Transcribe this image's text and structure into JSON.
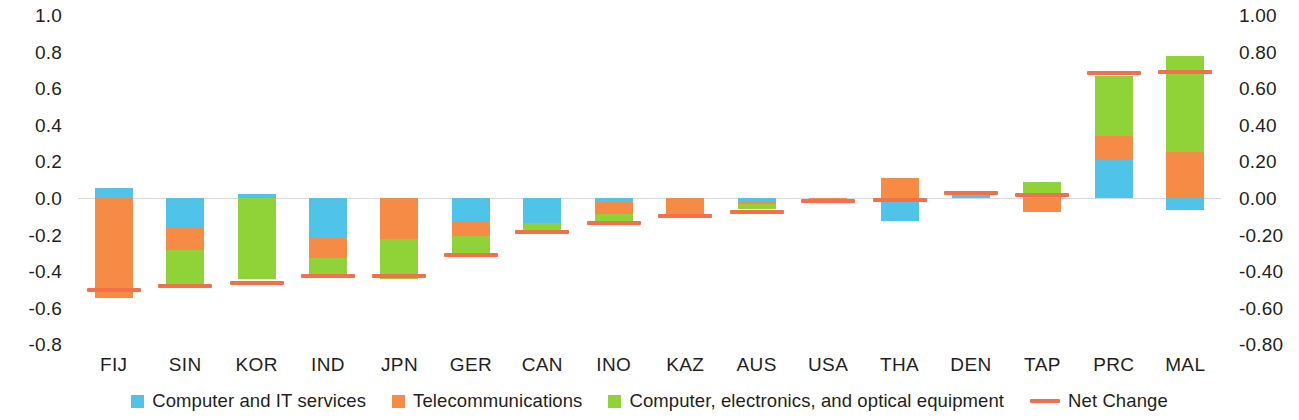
{
  "chart_data": {
    "type": "bar",
    "title": "",
    "subtitle": "",
    "xlabel": "",
    "ylabel": "",
    "stacked": true,
    "grid": false,
    "legend_position": "bottom",
    "categories": [
      "FIJ",
      "SIN",
      "KOR",
      "IND",
      "JPN",
      "GER",
      "CAN",
      "INO",
      "KAZ",
      "AUS",
      "USA",
      "THA",
      "DEN",
      "TAP",
      "PRC",
      "MAL"
    ],
    "left_axis": {
      "ticks": [
        "1.0",
        "0.8",
        "0.6",
        "0.4",
        "0.2",
        "0.0",
        "-0.2",
        "-0.4",
        "-0.6",
        "-0.8"
      ],
      "values": [
        1.0,
        0.8,
        0.6,
        0.4,
        0.2,
        0.0,
        -0.2,
        -0.4,
        -0.6,
        -0.8
      ],
      "ylim": [
        -0.8,
        1.0
      ]
    },
    "right_axis": {
      "ticks": [
        "1.00",
        "0.80",
        "0.60",
        "0.40",
        "0.20",
        "0.00",
        "-0.20",
        "-0.40",
        "-0.60",
        "-0.80"
      ],
      "values": [
        1.0,
        0.8,
        0.6,
        0.4,
        0.2,
        0.0,
        -0.2,
        -0.4,
        -0.6,
        -0.8
      ],
      "ylim": [
        -0.8,
        1.0
      ]
    },
    "series": [
      {
        "name": "Computer and IT services",
        "color": "#4FC3E8",
        "values": [
          0.055,
          -0.16,
          0.02,
          -0.22,
          0.0,
          -0.125,
          -0.135,
          -0.02,
          0.0,
          -0.015,
          0.0,
          -0.125,
          0.025,
          0.0,
          0.205,
          -0.065
        ]
      },
      {
        "name": "Telecommunications",
        "color": "#F58B45",
        "values": [
          -0.545,
          -0.125,
          0.0,
          -0.11,
          -0.225,
          -0.085,
          0.0,
          -0.065,
          -0.095,
          -0.02,
          -0.005,
          0.11,
          0.0,
          -0.075,
          0.135,
          0.25
        ]
      },
      {
        "name": "Computer, electronics, and optical equipment",
        "color": "#8FD338",
        "values": [
          0.0,
          -0.185,
          -0.445,
          -0.085,
          -0.215,
          -0.1,
          -0.045,
          -0.04,
          0.0,
          -0.025,
          0.0,
          0.0,
          0.0,
          0.09,
          0.325,
          0.525
        ]
      }
    ],
    "net_change": {
      "name": "Net Change",
      "color": "#F2714C",
      "values": [
        -0.5,
        -0.48,
        -0.465,
        -0.425,
        -0.425,
        -0.31,
        -0.185,
        -0.135,
        -0.1,
        -0.075,
        -0.015,
        -0.01,
        0.03,
        0.015,
        0.685,
        0.69
      ]
    }
  },
  "legend": {
    "items": [
      {
        "label": "Computer and IT services",
        "marker": "square",
        "color": "#4FC3E8"
      },
      {
        "label": "Telecommunications",
        "marker": "square",
        "color": "#F58B45"
      },
      {
        "label": "Computer, electronics, and optical equipment",
        "marker": "square",
        "color": "#8FD338"
      },
      {
        "label": "Net Change",
        "marker": "line",
        "color": "#F2714C"
      }
    ]
  }
}
